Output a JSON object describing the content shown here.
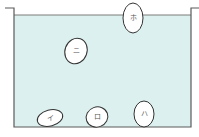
{
  "diagram": {
    "type": "water-tank-floating-objects",
    "colors": {
      "water": "#dcf0ef",
      "outline": "#5a5a5a",
      "egg_fill": "#ffffff",
      "egg_stroke": "#333333"
    },
    "tank": {
      "left_lip_x": 5,
      "left_wall_x": 14,
      "right_wall_x": 191,
      "right_lip_x": 199,
      "top_y": 8,
      "water_y": 15,
      "bottom_y": 127
    },
    "objects": [
      {
        "id": "i",
        "label": "イ",
        "cx": 50,
        "cy": 118,
        "rx": 13,
        "ry": 8,
        "rotate": -15,
        "position": "bottom"
      },
      {
        "id": "ro",
        "label": "ロ",
        "cx": 97,
        "cy": 117,
        "rx": 11,
        "ry": 10,
        "rotate": -20,
        "position": "bottom"
      },
      {
        "id": "ha",
        "label": "ハ",
        "cx": 144,
        "cy": 114,
        "rx": 10,
        "ry": 13,
        "rotate": 0,
        "position": "bottom"
      },
      {
        "id": "ni",
        "label": "ニ",
        "cx": 76,
        "cy": 51,
        "rx": 11,
        "ry": 13,
        "rotate": 20,
        "position": "middle"
      },
      {
        "id": "ho",
        "label": "ホ",
        "cx": 133,
        "cy": 18,
        "rx": 10,
        "ry": 15,
        "rotate": 0,
        "position": "surface"
      }
    ]
  }
}
